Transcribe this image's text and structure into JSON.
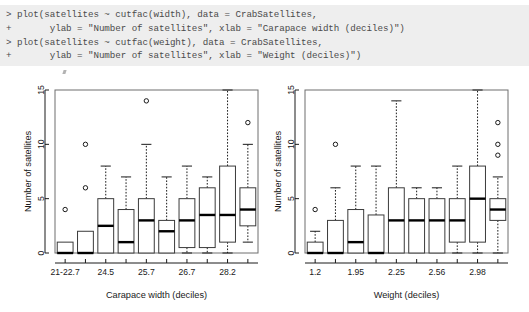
{
  "console": {
    "lines": [
      "> plot(satellites ~ cutfac(width), data = CrabSatellites,",
      "+       ylab = \"Number of satellites\", xlab = \"Carapace width (deciles)\")",
      "> plot(satellites ~ cutfac(weight), data = CrabSatellites,",
      "+       ylab = \"Number of satellites\", xlab = \"Weight (deciles)\")"
    ],
    "background": "#eeeeee"
  },
  "chart_data": [
    {
      "type": "boxplot",
      "id": "carapace-width-boxplot",
      "title": "",
      "xlabel": "Carapace width (deciles)",
      "ylabel": "Number of satellites",
      "ylim": [
        0,
        15
      ],
      "yticks": [
        0,
        5,
        10,
        15
      ],
      "grid": false,
      "categories": [
        "21-22.7",
        "",
        "24.5",
        "",
        "25.7",
        "",
        "26.7",
        "",
        "28.2",
        ""
      ],
      "tick_labels_shown": [
        "21-22.7",
        "24.5",
        "25.7",
        "26.7",
        "28.2"
      ],
      "boxes": [
        {
          "label": "21-22.7",
          "min": 0,
          "q1": 0,
          "median": 0,
          "q3": 1,
          "max": 1,
          "outliers": [
            4
          ]
        },
        {
          "label": "",
          "min": 0,
          "q1": 0,
          "median": 0,
          "q3": 2,
          "max": 2,
          "outliers": [
            6,
            10
          ]
        },
        {
          "label": "24.5",
          "min": 0,
          "q1": 0,
          "median": 2.5,
          "q3": 5,
          "max": 8,
          "outliers": []
        },
        {
          "label": "",
          "min": 0,
          "q1": 0,
          "median": 1,
          "q3": 4,
          "max": 7,
          "outliers": []
        },
        {
          "label": "25.7",
          "min": 0,
          "q1": 0,
          "median": 3,
          "q3": 5,
          "max": 10,
          "outliers": [
            14
          ]
        },
        {
          "label": "",
          "min": 0,
          "q1": 0,
          "median": 2,
          "q3": 3,
          "max": 7,
          "outliers": []
        },
        {
          "label": "26.7",
          "min": 0,
          "q1": 0.5,
          "median": 3,
          "q3": 5,
          "max": 8,
          "outliers": []
        },
        {
          "label": "",
          "min": 0,
          "q1": 0.5,
          "median": 3.5,
          "q3": 6,
          "max": 7,
          "outliers": []
        },
        {
          "label": "28.2",
          "min": 0,
          "q1": 1,
          "median": 3.5,
          "q3": 8,
          "max": 15,
          "outliers": []
        },
        {
          "label": "",
          "min": 1,
          "q1": 2.5,
          "median": 4,
          "q3": 6,
          "max": 10,
          "outliers": [
            12
          ]
        }
      ]
    },
    {
      "type": "boxplot",
      "id": "weight-boxplot",
      "title": "",
      "xlabel": "Weight (deciles)",
      "ylabel": "Number of satellites",
      "ylim": [
        0,
        15
      ],
      "yticks": [
        0,
        5,
        10,
        15
      ],
      "grid": false,
      "categories": [
        "1.2",
        "",
        "1.95",
        "",
        "2.25",
        "",
        "2.56",
        "",
        "2.98",
        ""
      ],
      "tick_labels_shown": [
        "1.2",
        "1.95",
        "2.25",
        "2.56",
        "2.98"
      ],
      "boxes": [
        {
          "label": "1.2",
          "min": 0,
          "q1": 0,
          "median": 0,
          "q3": 1,
          "max": 2,
          "outliers": [
            4
          ]
        },
        {
          "label": "",
          "min": 0,
          "q1": 0,
          "median": 0,
          "q3": 3,
          "max": 6,
          "outliers": [
            10
          ]
        },
        {
          "label": "1.95",
          "min": 0,
          "q1": 0,
          "median": 1,
          "q3": 4,
          "max": 8,
          "outliers": []
        },
        {
          "label": "",
          "min": 0,
          "q1": 0,
          "median": 0,
          "q3": 3.5,
          "max": 8,
          "outliers": []
        },
        {
          "label": "2.25",
          "min": 0,
          "q1": 0,
          "median": 3,
          "q3": 6,
          "max": 14,
          "outliers": []
        },
        {
          "label": "",
          "min": 0,
          "q1": 0,
          "median": 3,
          "q3": 5,
          "max": 6,
          "outliers": []
        },
        {
          "label": "2.56",
          "min": 0,
          "q1": 0,
          "median": 3,
          "q3": 5,
          "max": 6,
          "outliers": []
        },
        {
          "label": "",
          "min": 0,
          "q1": 1,
          "median": 3,
          "q3": 5,
          "max": 8,
          "outliers": []
        },
        {
          "label": "2.98",
          "min": 0,
          "q1": 1,
          "median": 5,
          "q3": 8,
          "max": 15,
          "outliers": []
        },
        {
          "label": "",
          "min": 0,
          "q1": 3,
          "median": 4,
          "q3": 5,
          "max": 7,
          "outliers": [
            9,
            10,
            12
          ]
        }
      ]
    }
  ]
}
